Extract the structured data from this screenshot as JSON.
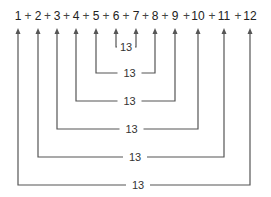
{
  "diagram": {
    "terms": [
      "1",
      "2",
      "3",
      "4",
      "5",
      "6",
      "7",
      "8",
      "9",
      "10",
      "11",
      "12"
    ],
    "operator": "+",
    "pair_sum_label": "13",
    "pairs": [
      {
        "left": "6",
        "right": "7",
        "sum": "13"
      },
      {
        "left": "5",
        "right": "8",
        "sum": "13"
      },
      {
        "left": "4",
        "right": "9",
        "sum": "13"
      },
      {
        "left": "3",
        "right": "10",
        "sum": "13"
      },
      {
        "left": "2",
        "right": "11",
        "sum": "13"
      },
      {
        "left": "1",
        "right": "12",
        "sum": "13"
      }
    ],
    "line_color": "#555555",
    "text_color": "#222222"
  }
}
